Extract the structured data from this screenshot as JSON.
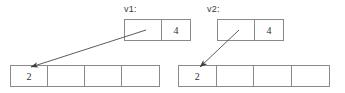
{
  "diagram": {
    "title": "",
    "background_color": "#ffffff",
    "line_color": "#8a8a8a",
    "arrow_color": "#4a4a4a",
    "text_color": "#2e2e2e",
    "pointers": [
      {
        "id": "v1",
        "label": "v1:",
        "label_x": 124,
        "label_y": 4,
        "box_x": 124,
        "box_y": 19,
        "box_w": 67,
        "box_h": 22,
        "cells": [
          {
            "value": "",
            "width": 38
          },
          {
            "value": "4",
            "width": 29
          }
        ]
      },
      {
        "id": "v2",
        "label": "v2:",
        "label_x": 207,
        "label_y": 4,
        "box_x": 217,
        "box_y": 19,
        "box_w": 67,
        "box_h": 22,
        "cells": [
          {
            "value": "",
            "width": 38
          },
          {
            "value": "4",
            "width": 29
          }
        ]
      }
    ],
    "arrays": [
      {
        "id": "array-left",
        "box_x": 10,
        "box_y": 65,
        "box_w": 150,
        "box_h": 22,
        "cells": [
          {
            "value": "2"
          },
          {
            "value": ""
          },
          {
            "value": ""
          },
          {
            "value": ""
          }
        ]
      },
      {
        "id": "array-right",
        "box_x": 178,
        "box_y": 65,
        "box_w": 152,
        "box_h": 22,
        "cells": [
          {
            "value": "2"
          },
          {
            "value": ""
          },
          {
            "value": ""
          },
          {
            "value": ""
          }
        ]
      }
    ],
    "arrows": [
      {
        "id": "arrow-v1-to-array-left",
        "from_x": 146,
        "from_y": 30,
        "to_x": 31,
        "to_y": 67
      },
      {
        "id": "arrow-v2-to-array-right",
        "from_x": 239,
        "from_y": 30,
        "to_x": 200,
        "to_y": 67
      }
    ]
  }
}
